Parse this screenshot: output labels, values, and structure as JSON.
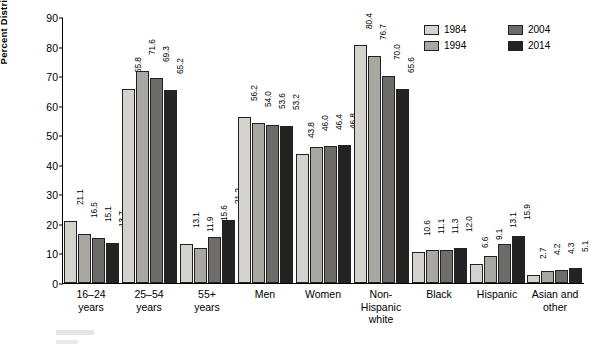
{
  "chart_data": {
    "type": "bar",
    "title": "",
    "xlabel": "",
    "ylabel": "Percent Distribution",
    "ylim": [
      0,
      90
    ],
    "yticks": [
      0,
      10,
      20,
      30,
      40,
      50,
      60,
      70,
      80,
      90
    ],
    "grid": false,
    "legend_position": "top-right",
    "categories": [
      "16–24 years",
      "25–54 years",
      "55+ years",
      "Men",
      "Women",
      "Non-Hispanic white",
      "Black",
      "Hispanic",
      "Asian and other"
    ],
    "category_lines": [
      [
        "16–24",
        "years"
      ],
      [
        "25–54",
        "years"
      ],
      [
        "55+",
        "years"
      ],
      [
        "Men"
      ],
      [
        "Women"
      ],
      [
        "Non-",
        "Hispanic",
        "white"
      ],
      [
        "Black"
      ],
      [
        "Hispanic"
      ],
      [
        "Asian and",
        "other"
      ]
    ],
    "series": [
      {
        "name": "1984",
        "color": "#d4d2cd",
        "values": [
          21.1,
          65.8,
          13.1,
          56.2,
          43.8,
          80.4,
          10.6,
          6.6,
          2.7
        ]
      },
      {
        "name": "1994",
        "color": "#a9a7a2",
        "values": [
          16.5,
          71.6,
          11.9,
          54.0,
          46.0,
          76.7,
          11.1,
          9.1,
          4.2
        ]
      },
      {
        "name": "2004",
        "color": "#6e6c68",
        "values": [
          15.1,
          69.3,
          15.6,
          53.6,
          46.4,
          70.0,
          11.3,
          13.1,
          4.3
        ]
      },
      {
        "name": "2014",
        "color": "#232323",
        "values": [
          13.7,
          65.2,
          21.2,
          53.2,
          46.8,
          65.6,
          12.0,
          15.9,
          5.1
        ]
      }
    ]
  }
}
